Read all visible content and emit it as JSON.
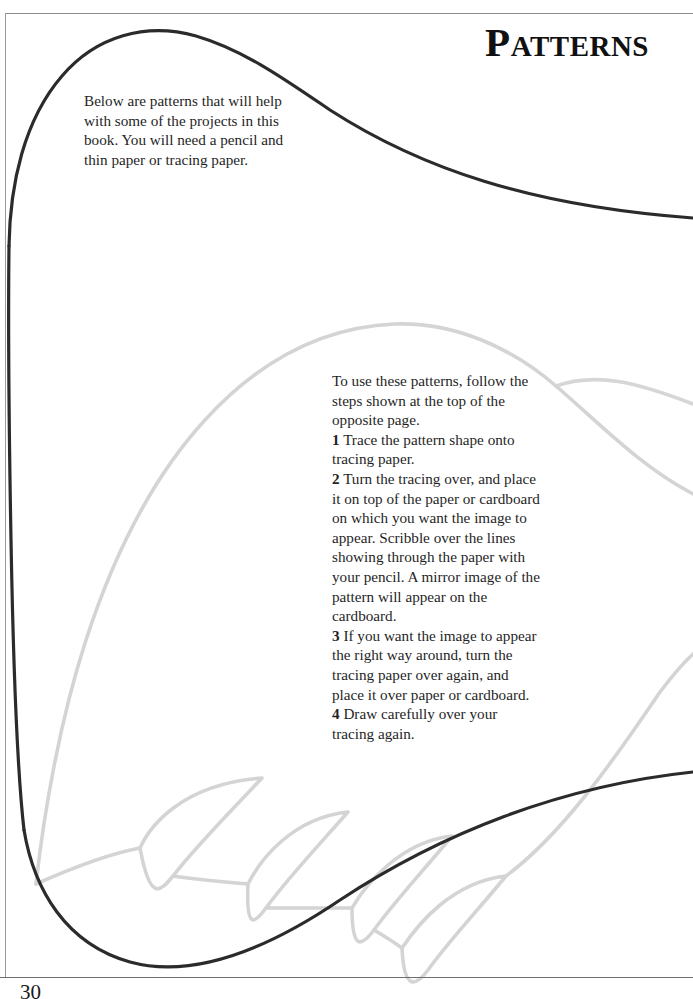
{
  "page": {
    "title": "Patterns",
    "number": "30",
    "border_color": "#8c8c8c",
    "background": "#ffffff"
  },
  "intro": {
    "text": "Below are patterns that will help with some of the projects in this book. You will need a pencil and thin paper or tracing paper."
  },
  "instructions": {
    "lead": "To use these patterns, follow the steps shown at the top of the opposite page.",
    "steps": [
      {
        "number": "1",
        "text": "Trace the pattern shape onto tracing paper."
      },
      {
        "number": "2",
        "text": "Turn the tracing over, and place it on top of the paper or cardboard on which you want the image to appear. Scribble over the lines showing through the paper with your pencil. A mirror image of the pattern will appear on the cardboard."
      },
      {
        "number": "3",
        "text": "If you want the image to appear the right way around, turn the tracing paper over again, and place it over paper or cardboard."
      },
      {
        "number": "4",
        "text": "Draw carefully over your tracing again."
      }
    ]
  },
  "artwork": {
    "dark_stroke_color": "#2b2b2b",
    "light_stroke_color": "#d4d4d4",
    "dark_stroke_width": 3.2,
    "light_stroke_width": 3.6,
    "description": "Two overlapping outline pattern templates: a large dark teardrop/leaf outline and a lighter gray fish-body outline with four pointed fin spikes along its lower edge."
  }
}
